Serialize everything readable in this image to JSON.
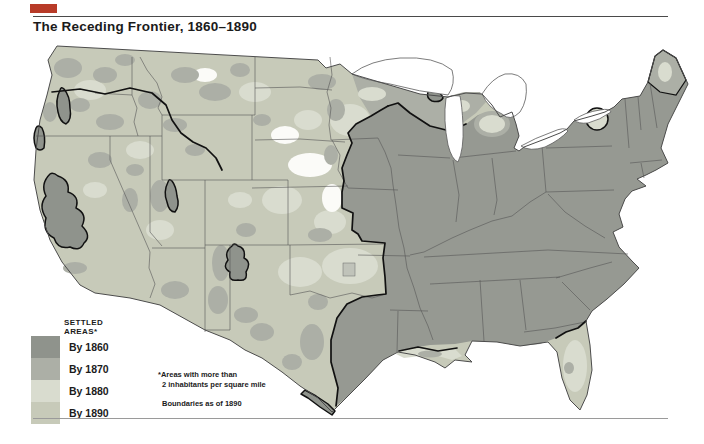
{
  "title": "The Receding Frontier, 1860–1890",
  "marker": {
    "color": "#b83b28"
  },
  "legend": {
    "header": "SETTLED AREAS*",
    "items": [
      {
        "label": "By 1860",
        "color": "#8f938c"
      },
      {
        "label": "By 1870",
        "color": "#acafa6"
      },
      {
        "label": "By 1880",
        "color": "#d9dccf"
      },
      {
        "label": "By 1890",
        "color": "#c7cab9"
      }
    ]
  },
  "footnote": {
    "line1": "*Areas with more than",
    "line2": "2 inhabitants per square mile",
    "line3": "Boundaries as of 1890"
  },
  "map": {
    "unsettled_color": "#ffffff",
    "frontier_line_color": "#111111",
    "state_line_color": "#565656"
  }
}
